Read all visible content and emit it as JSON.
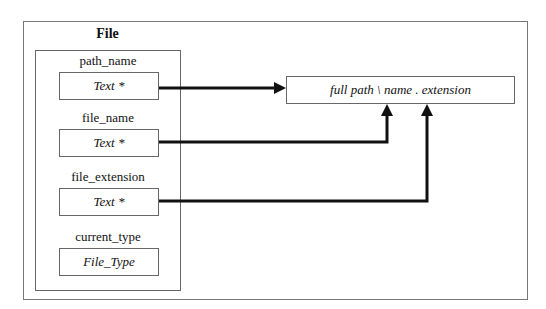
{
  "diagram": {
    "title": "File",
    "fields": [
      {
        "name": "path_name",
        "type": "Text *"
      },
      {
        "name": "file_name",
        "type": "Text *"
      },
      {
        "name": "file_extension",
        "type": "Text *"
      },
      {
        "name": "current_type",
        "type": "File_Type"
      }
    ],
    "target": {
      "label": "full path \\ name . extension"
    },
    "connections": [
      {
        "from": "path_name",
        "to": "target",
        "route": "horizontal"
      },
      {
        "from": "file_name",
        "to": "target",
        "route": "right-then-up"
      },
      {
        "from": "file_extension",
        "to": "target",
        "route": "right-then-up"
      }
    ],
    "colors": {
      "line": "#111111",
      "border": "#666666",
      "background": "#ffffff"
    }
  }
}
